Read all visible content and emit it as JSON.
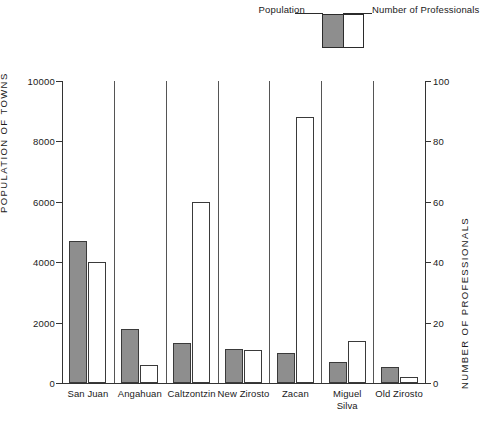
{
  "legend": {
    "population_label": "Population",
    "professionals_label": "Number of Professionals",
    "population_color": "#8e8e8e",
    "professionals_color": "#ffffff"
  },
  "axes": {
    "left_title": "POPULATION  OF  TOWNS",
    "right_title": "NUMBER  OF  PROFESSIONALS",
    "left_ticks": [
      "0",
      "2000",
      "4000",
      "6000",
      "8000",
      "10000"
    ],
    "right_ticks": [
      "0",
      "20",
      "40",
      "60",
      "80",
      "100"
    ]
  },
  "chart_data": {
    "type": "bar",
    "title": "",
    "xlabel": "",
    "ylabel": "POPULATION  OF  TOWNS",
    "y2label": "NUMBER  OF  PROFESSIONALS",
    "ylim": [
      0,
      10000
    ],
    "y2lim": [
      0,
      100
    ],
    "grid": false,
    "legend_position": "top-right",
    "categories": [
      "San Juan",
      "Angahuan",
      "Caltzontzin",
      "New Zirosto",
      "Zacan",
      "Miguel Silva",
      "Old Zirosto"
    ],
    "category_lines": [
      [
        "San Juan"
      ],
      [
        "Angahuan"
      ],
      [
        "Caltzontzin"
      ],
      [
        "New Zirosto"
      ],
      [
        "Zacan"
      ],
      [
        "Miguel",
        "Silva"
      ],
      [
        "Old Zirosto"
      ]
    ],
    "series": [
      {
        "name": "Population",
        "axis": "left",
        "color": "#8e8e8e",
        "values": [
          4700,
          1780,
          1330,
          1130,
          980,
          690,
          520
        ]
      },
      {
        "name": "Number of Professionals",
        "axis": "right",
        "color": "#ffffff",
        "values": [
          40,
          6,
          60,
          11,
          88,
          14,
          2
        ]
      }
    ]
  }
}
